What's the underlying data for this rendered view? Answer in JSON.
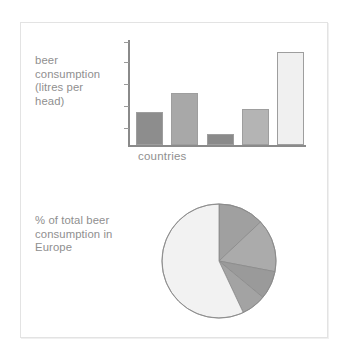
{
  "figure": {
    "frame_color": "#e3e3e3",
    "background": "#ffffff",
    "text_color": "#8f8f8f"
  },
  "bar_section": {
    "axis_title": "beer\nconsumption\n(litres per\nhead)",
    "x_axis_label": "countries"
  },
  "pie_section": {
    "caption": "% of total beer\nconsumption in\nEurope"
  },
  "chart_data": [
    {
      "type": "bar",
      "title": "",
      "xlabel": "countries",
      "ylabel": "beer consumption (litres per head)",
      "categories": [
        "1",
        "2",
        "3",
        "4",
        "5"
      ],
      "values": [
        33,
        52,
        11,
        36,
        93
      ],
      "ylim": [
        0,
        105
      ],
      "grid": false,
      "legend": "none",
      "y_tick_count": 5,
      "y_tick_labels": [],
      "x_tick_labels": [],
      "bar_colors": [
        "#8d8d8d",
        "#a8a8a8",
        "#8a8a8a",
        "#b4b4b4",
        "#f0f0f0"
      ],
      "bar_edge_color": "#9e9e9e",
      "axis_color": "#8a8a8a"
    },
    {
      "type": "pie",
      "title": "% of total beer consumption in Europe",
      "labels": [
        "slice-1",
        "slice-2",
        "slice-3",
        "slice-4",
        "slice-5"
      ],
      "values": [
        13,
        15,
        8,
        7,
        57
      ],
      "colors": [
        "#a0a0a0",
        "#ababab",
        "#9a9a9a",
        "#a3a3a3",
        "#f2f2f2"
      ],
      "edge_color": "#8a8a8a",
      "start_angle_deg": 0,
      "direction": "clockwise",
      "legend": "none"
    }
  ]
}
